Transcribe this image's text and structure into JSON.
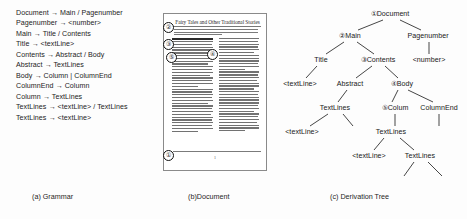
{
  "figure": {
    "captions": {
      "a": "(a) Grammar",
      "b": "(b)Document",
      "c": "(c) Derivation Tree"
    }
  },
  "grammar": {
    "rules": [
      "Document → Main / Pagenumber",
      "Pagenumber → <number>",
      "Main → Title / Contents",
      "Title → <textLine>",
      "Contents → Abstract / Body",
      "Abstract → TextLines",
      "Body → Column | ColumnEnd",
      "ColumnEnd → Column",
      "Column → TextLines",
      "TextLines → <textLine> / TextLines",
      "TextLines → <textLine>"
    ]
  },
  "document": {
    "title": "Fairy Tales and Other Traditional Stories",
    "page_number": "1",
    "markers": [
      {
        "label": "①",
        "name": "marker-1-document"
      },
      {
        "label": "②",
        "name": "marker-2-main"
      },
      {
        "label": "③",
        "name": "marker-3-contents"
      },
      {
        "label": "④",
        "name": "marker-4-body"
      },
      {
        "label": "⑤",
        "name": "marker-5-column"
      }
    ]
  },
  "tree": {
    "nodes": [
      {
        "label": "①Document",
        "circled": true,
        "x": 112,
        "y": 6
      },
      {
        "label": "②Main",
        "circled": true,
        "x": 72,
        "y": 28
      },
      {
        "label": "Pagenumber",
        "circled": false,
        "x": 150,
        "y": 28
      },
      {
        "label": "Title",
        "circled": false,
        "x": 43,
        "y": 52
      },
      {
        "label": "③Contents",
        "circled": true,
        "x": 100,
        "y": 52
      },
      {
        "label": "<number>",
        "circled": false,
        "x": 151,
        "y": 52
      },
      {
        "label": "<textLine>",
        "circled": false,
        "x": 22,
        "y": 76
      },
      {
        "label": "Abstract",
        "circled": false,
        "x": 72,
        "y": 76
      },
      {
        "label": "④Body",
        "circled": true,
        "x": 124,
        "y": 76
      },
      {
        "label": "TextLines",
        "circled": false,
        "x": 57,
        "y": 100
      },
      {
        "label": "⑤Colum",
        "circled": true,
        "x": 117,
        "y": 100
      },
      {
        "label": "ColumnEnd",
        "circled": false,
        "x": 161,
        "y": 100
      },
      {
        "label": "<textLine>",
        "circled": false,
        "x": 24,
        "y": 124
      },
      {
        "label": "TextLines",
        "circled": false,
        "x": 113,
        "y": 124
      },
      {
        "label": "<textLine>",
        "circled": false,
        "x": 91,
        "y": 148
      },
      {
        "label": "TextLines",
        "circled": false,
        "x": 142,
        "y": 148
      }
    ]
  }
}
